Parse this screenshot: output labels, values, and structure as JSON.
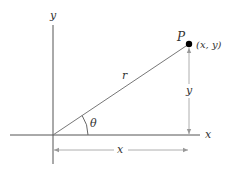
{
  "diagram": {
    "axes": {
      "x_label": "x",
      "y_label": "y"
    },
    "point": {
      "name": "P",
      "coords_label": "(x, y)"
    },
    "radius_label": "r",
    "angle_label": "θ",
    "vertical_dimension_label": "y",
    "horizontal_dimension_label": "x",
    "colors": {
      "axis": "#555555",
      "line": "#777777",
      "dimension": "#999999",
      "point": "#000000",
      "text": "#333333"
    }
  }
}
